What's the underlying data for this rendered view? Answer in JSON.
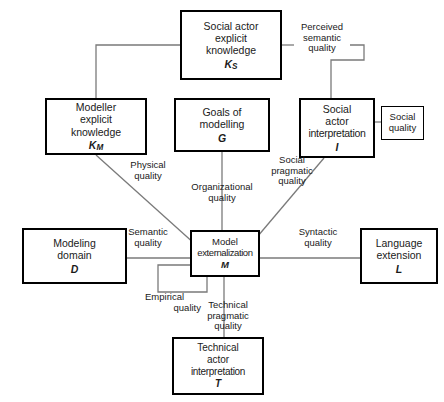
{
  "diagram": {
    "nodes": [
      {
        "id": "Ks",
        "name": "social-actor-explicit-knowledge",
        "lines": [
          "Social actor",
          "explicit",
          "knowledge"
        ],
        "symbol": "K",
        "subscript": "S"
      },
      {
        "id": "Km",
        "name": "modeller-explicit-knowledge",
        "lines": [
          "Modeller",
          "explicit",
          "knowledge"
        ],
        "symbol": "K",
        "subscript": "M"
      },
      {
        "id": "G",
        "name": "goals-of-modelling",
        "lines": [
          "Goals of",
          "modelling"
        ],
        "symbol": "G",
        "subscript": ""
      },
      {
        "id": "I",
        "name": "social-actor-interpretation",
        "lines": [
          "Social",
          "actor",
          "interpretation"
        ],
        "symbol": "I",
        "subscript": ""
      },
      {
        "id": "D",
        "name": "modeling-domain",
        "lines": [
          "Modeling",
          "domain"
        ],
        "symbol": "D",
        "subscript": ""
      },
      {
        "id": "M",
        "name": "model-externalization",
        "lines": [
          "Model",
          "externalization"
        ],
        "symbol": "M",
        "subscript": ""
      },
      {
        "id": "L",
        "name": "language-extension",
        "lines": [
          "Language",
          "extension"
        ],
        "symbol": "L",
        "subscript": ""
      },
      {
        "id": "T",
        "name": "technical-actor-interpretation",
        "lines": [
          "Technical",
          "actor",
          "interpretation"
        ],
        "symbol": "T",
        "subscript": ""
      }
    ],
    "annotation_box": {
      "id": "social_quality",
      "name": "social-quality-annotation",
      "lines": [
        "Social",
        "quality"
      ]
    },
    "edge_labels": [
      {
        "id": "perceived_semantic",
        "name": "edge-label-perceived-semantic-quality",
        "lines": [
          "Perceived",
          "semantic",
          "quality"
        ],
        "connects": [
          "Ks",
          "I"
        ]
      },
      {
        "id": "physical",
        "name": "edge-label-physical-quality",
        "lines": [
          "Physical",
          "quality"
        ],
        "connects": [
          "Km",
          "M"
        ]
      },
      {
        "id": "organizational",
        "name": "edge-label-organizational-quality",
        "lines": [
          "Organizational",
          "quality"
        ],
        "connects": [
          "G",
          "M"
        ]
      },
      {
        "id": "social_pragmatic",
        "name": "edge-label-social-pragmatic-quality",
        "lines": [
          "Social",
          "pragmatic",
          "quality"
        ],
        "connects": [
          "I",
          "M"
        ]
      },
      {
        "id": "semantic",
        "name": "edge-label-semantic-quality",
        "lines": [
          "Semantic",
          "quality"
        ],
        "connects": [
          "D",
          "M"
        ]
      },
      {
        "id": "syntactic",
        "name": "edge-label-syntactic-quality",
        "lines": [
          "Syntactic",
          "quality"
        ],
        "connects": [
          "M",
          "L"
        ]
      },
      {
        "id": "empirical",
        "name": "edge-label-empirical-quality",
        "lines": [
          "Empirical",
          "quality"
        ],
        "connects": [
          "M",
          "M"
        ]
      },
      {
        "id": "technical_pragmatic",
        "name": "edge-label-technical-pragmatic-quality",
        "lines": [
          "Technical",
          "pragmatic",
          "quality"
        ],
        "connects": [
          "M",
          "T"
        ]
      }
    ],
    "colors": {
      "stroke": "#000000",
      "background": "#ffffff",
      "line": "#6e6e6e"
    }
  }
}
